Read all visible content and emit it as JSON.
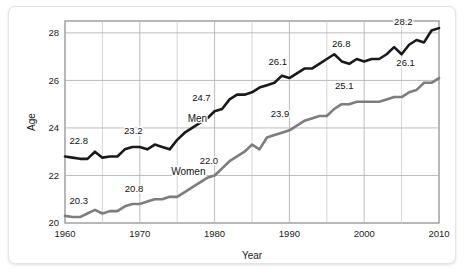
{
  "figure": {
    "background_color": "#ffffff",
    "card_color": "#ffffff",
    "plot_background": "#ffffff",
    "grid_color": "#c9c9c9",
    "frame_color": "#9a9a9a"
  },
  "chart_data": {
    "type": "line",
    "title": "",
    "subtitle": "",
    "xlabel": "Year",
    "ylabel": "Age",
    "xlim": [
      1960,
      2010
    ],
    "ylim": [
      20,
      28.5
    ],
    "xticks": [
      1960,
      1970,
      1980,
      1990,
      2000,
      2010
    ],
    "xtick_labels": [
      "1960",
      "1970",
      "1980",
      "1990",
      "2000",
      "2010"
    ],
    "yticks": [
      20,
      22,
      24,
      26,
      28
    ],
    "ytick_labels": [
      "20",
      "22",
      "24",
      "26",
      "28"
    ],
    "x_gridlines": [
      1965,
      1970,
      1975,
      1980,
      1985,
      1990,
      1995,
      2000,
      2005
    ],
    "y_gridlines": [
      22,
      24,
      26,
      28
    ],
    "grid": true,
    "legend_position": "inline",
    "series": [
      {
        "name": "Men",
        "color": "#1a1a1a",
        "line_width": 2.6,
        "label_text": "Men",
        "label_x": 1976.4,
        "label_y": 24.25,
        "x": [
          1960,
          1961,
          1962,
          1963,
          1964,
          1965,
          1966,
          1967,
          1968,
          1969,
          1970,
          1971,
          1972,
          1973,
          1974,
          1975,
          1976,
          1977,
          1978,
          1979,
          1980,
          1981,
          1982,
          1983,
          1984,
          1985,
          1986,
          1987,
          1988,
          1989,
          1990,
          1991,
          1992,
          1993,
          1994,
          1995,
          1996,
          1997,
          1998,
          1999,
          2000,
          2001,
          2002,
          2003,
          2004,
          2005,
          2006,
          2007,
          2008,
          2009,
          2010
        ],
        "y": [
          22.8,
          22.75,
          22.7,
          22.7,
          23.0,
          22.75,
          22.8,
          22.8,
          23.1,
          23.2,
          23.2,
          23.1,
          23.3,
          23.2,
          23.1,
          23.5,
          23.8,
          24.0,
          24.2,
          24.4,
          24.7,
          24.8,
          25.2,
          25.4,
          25.4,
          25.5,
          25.7,
          25.8,
          25.9,
          26.2,
          26.1,
          26.3,
          26.5,
          26.5,
          26.7,
          26.9,
          27.1,
          26.8,
          26.7,
          26.9,
          26.8,
          26.9,
          26.9,
          27.1,
          27.4,
          27.1,
          27.5,
          27.7,
          27.6,
          28.1,
          28.2
        ],
        "labeled_points": [
          {
            "year": 1960,
            "value": "22.8",
            "x": 1960.6,
            "y": 23.32,
            "anchor": "start"
          },
          {
            "year": 1969,
            "value": "23.2",
            "x": 1967.9,
            "y": 23.74,
            "anchor": "start"
          },
          {
            "year": 1980,
            "value": "24.7",
            "x": 1977.0,
            "y": 25.14,
            "anchor": "start"
          },
          {
            "year": 1990,
            "value": "26.1",
            "x": 1987.2,
            "y": 26.66,
            "anchor": "start"
          },
          {
            "year": 1997,
            "value": "26.8",
            "x": 1995.7,
            "y": 27.42,
            "anchor": "start"
          },
          {
            "year": 2010,
            "value": "28.2",
            "x": 2004.0,
            "y": 28.32,
            "anchor": "start"
          }
        ]
      },
      {
        "name": "Women",
        "color": "#7d7d7d",
        "line_width": 2.6,
        "label_text": "Women",
        "label_x": 1974.2,
        "label_y": 22.02,
        "x": [
          1960,
          1961,
          1962,
          1963,
          1964,
          1965,
          1966,
          1967,
          1968,
          1969,
          1970,
          1971,
          1972,
          1973,
          1974,
          1975,
          1976,
          1977,
          1978,
          1979,
          1980,
          1981,
          1982,
          1983,
          1984,
          1985,
          1986,
          1987,
          1988,
          1989,
          1990,
          1991,
          1992,
          1993,
          1994,
          1995,
          1996,
          1997,
          1998,
          1999,
          2000,
          2001,
          2002,
          2003,
          2004,
          2005,
          2006,
          2007,
          2008,
          2009,
          2010
        ],
        "y": [
          20.3,
          20.25,
          20.25,
          20.4,
          20.55,
          20.4,
          20.5,
          20.5,
          20.7,
          20.8,
          20.8,
          20.9,
          21.0,
          21.0,
          21.1,
          21.1,
          21.3,
          21.5,
          21.7,
          21.9,
          22.0,
          22.3,
          22.6,
          22.8,
          23.0,
          23.3,
          23.1,
          23.6,
          23.7,
          23.8,
          23.9,
          24.1,
          24.3,
          24.4,
          24.5,
          24.5,
          24.8,
          25.0,
          25.0,
          25.1,
          25.1,
          25.1,
          25.1,
          25.2,
          25.3,
          25.3,
          25.5,
          25.6,
          25.9,
          25.9,
          26.1
        ],
        "labeled_points": [
          {
            "year": 1960,
            "value": "20.3",
            "x": 1960.6,
            "y": 20.82,
            "anchor": "start"
          },
          {
            "year": 1969,
            "value": "20.8",
            "x": 1968.0,
            "y": 21.3,
            "anchor": "start"
          },
          {
            "year": 1980,
            "value": "22.0",
            "x": 1978.0,
            "y": 22.5,
            "anchor": "start"
          },
          {
            "year": 1990,
            "value": "23.9",
            "x": 1987.5,
            "y": 24.44,
            "anchor": "start"
          },
          {
            "year": 1999,
            "value": "25.1",
            "x": 1996.1,
            "y": 25.64,
            "anchor": "start"
          },
          {
            "year": 2010,
            "value": "26.1",
            "x": 2004.3,
            "y": 26.62,
            "anchor": "start"
          }
        ]
      }
    ]
  }
}
